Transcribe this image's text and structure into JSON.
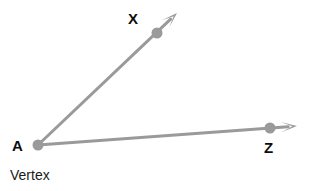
{
  "figure": {
    "background_color": "#ffffff",
    "stroke_color": "#9a9a9a",
    "label_color": "#0d0d0d",
    "caption_color": "#1a1a1a",
    "stroke_width": 3,
    "dot_radius": 5.5,
    "width": 309,
    "height": 191
  },
  "labels": {
    "vertex_point": "A",
    "ray_upper_point": "X",
    "ray_lower_point": "Z",
    "vertex_caption": "Vertex"
  },
  "geometry": {
    "vertex": {
      "name": "A",
      "x": 38,
      "y": 145
    },
    "points": [
      {
        "name": "X",
        "x": 157,
        "y": 33
      },
      {
        "name": "Z",
        "x": 270,
        "y": 128
      }
    ],
    "rays": [
      {
        "name": "ray-AX",
        "from": "A",
        "through": "X",
        "x1": 38,
        "y1": 145,
        "x2": 177,
        "y2": 13,
        "arrowhead": true
      },
      {
        "name": "ray-AZ",
        "from": "A",
        "through": "Z",
        "x1": 38,
        "y1": 145,
        "x2": 297,
        "y2": 126,
        "arrowhead": true
      }
    ]
  }
}
